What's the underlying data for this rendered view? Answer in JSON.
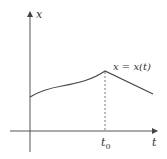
{
  "diagram": {
    "type": "function-graph",
    "axes": {
      "x_label": "t",
      "y_label": "x"
    },
    "curve_label": "x = x(t)",
    "marker": {
      "label_base": "t",
      "label_sub": "0",
      "description": "dashed vertical line from peak of curve down to t-axis"
    },
    "colors": {
      "axis": "#555555",
      "curve": "#444444",
      "text": "#333333"
    }
  }
}
